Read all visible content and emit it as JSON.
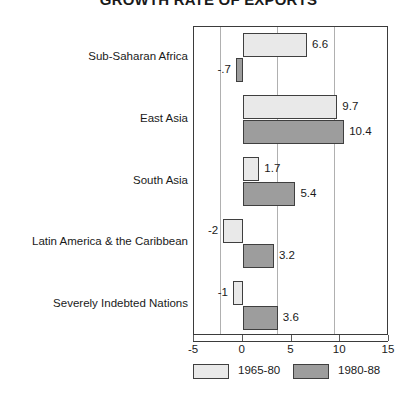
{
  "chart_data": {
    "type": "bar",
    "orientation": "horizontal",
    "title": "GROWTH RATE OF EXPORTS",
    "xlabel": "",
    "ylabel": "",
    "xlim": [
      -5,
      15
    ],
    "xticks": [
      -5,
      0,
      5,
      10,
      15
    ],
    "xtick_labels": [
      "-5",
      "0",
      "5",
      "10",
      "15"
    ],
    "grid": true,
    "gridlines_at": [
      0,
      5,
      10
    ],
    "legend_position": "bottom",
    "categories": [
      "Sub-Saharan Africa",
      "East Asia",
      "South Asia",
      "Latin America & the Caribbean",
      "Severely Indebted Nations"
    ],
    "series": [
      {
        "name": "1965-80",
        "color": "#e9e9e9",
        "values": [
          6.6,
          9.7,
          1.7,
          -2,
          -1
        ],
        "value_labels": [
          "6.6",
          "9.7",
          "1.7",
          "-2",
          "-1"
        ]
      },
      {
        "name": "1980-88",
        "color": "#9d9d9d",
        "values": [
          -0.7,
          10.4,
          5.4,
          3.2,
          3.6
        ],
        "value_labels": [
          "-.7",
          "10.4",
          "5.4",
          "3.2",
          "3.6"
        ]
      }
    ]
  },
  "legend": {
    "items": [
      {
        "label": "1965-80",
        "tone": "light"
      },
      {
        "label": "1980-88",
        "tone": "dark"
      }
    ]
  }
}
